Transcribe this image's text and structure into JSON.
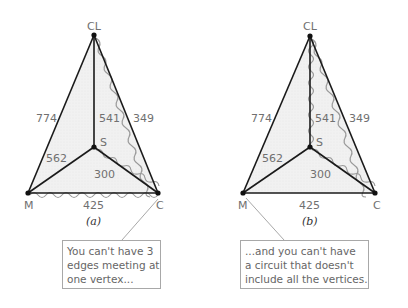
{
  "panels": [
    {
      "id": "a",
      "caption": "(a)",
      "vertices": {
        "CL": "CL",
        "M": "M",
        "C": "C",
        "S": "S"
      },
      "edges": {
        "M-CL": "774",
        "S-CL": "541",
        "C-CL": "349",
        "M-S": "562",
        "S-C": "300",
        "M-C": "425"
      },
      "highlighted_edges": [
        "CL-C",
        "S-C",
        "M-C"
      ],
      "note": [
        "You can't have 3",
        "edges meeting at",
        "one vertex..."
      ]
    },
    {
      "id": "b",
      "caption": "(b)",
      "vertices": {
        "CL": "CL",
        "M": "M",
        "C": "C",
        "S": "S"
      },
      "edges": {
        "M-CL": "774",
        "S-CL": "541",
        "C-CL": "349",
        "M-S": "562",
        "S-C": "300",
        "M-C": "425"
      },
      "highlighted_edges": [
        "CL-S",
        "S-C",
        "CL-C"
      ],
      "note": [
        "...and you can't have",
        "a circuit that doesn't",
        "include all the vertices."
      ]
    }
  ],
  "colors": {
    "fill": "#efefef",
    "edge": "#1a1a1a",
    "highlight": "#9a9a9a",
    "label": "#707070"
  }
}
